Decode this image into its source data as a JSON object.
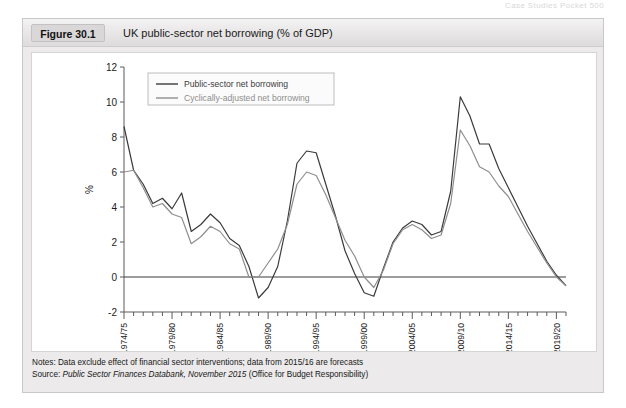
{
  "page_header": "Case Studies Pocket 500",
  "figure": {
    "tag": "Figure 30.1",
    "title": "UK public-sector net borrowing (% of GDP)"
  },
  "notes": {
    "notes_label": "Notes:",
    "notes_text": " Data exclude effect of financial sector interventions; data from 2015/16 are forecasts",
    "source_label": "Source:",
    "source_italic": "Public Sector Finances Databank, November 2015",
    "source_tail": " (Office for Budget Responsibility)"
  },
  "chart_data": {
    "type": "line",
    "title": "UK public-sector net borrowing (% of GDP)",
    "xlabel": "",
    "ylabel": "%",
    "ylim": [
      -2,
      12
    ],
    "yticks": [
      -2,
      0,
      2,
      4,
      6,
      8,
      10,
      12
    ],
    "grid": false,
    "zero_line": true,
    "legend_position": "top-left",
    "x_tick_labels": [
      "1974/75",
      "1979/80",
      "1984/85",
      "1989/90",
      "1994/95",
      "1999/00",
      "2004/05",
      "2009/10",
      "2014/15",
      "2019/20"
    ],
    "x_tick_label_interval": 5,
    "categories": [
      "1974/75",
      "1975/76",
      "1976/77",
      "1977/78",
      "1978/79",
      "1979/80",
      "1980/81",
      "1981/82",
      "1982/83",
      "1983/84",
      "1984/85",
      "1985/86",
      "1986/87",
      "1987/88",
      "1988/89",
      "1989/90",
      "1990/91",
      "1991/92",
      "1992/93",
      "1993/94",
      "1994/95",
      "1995/96",
      "1996/97",
      "1997/98",
      "1998/99",
      "1999/00",
      "2000/01",
      "2001/02",
      "2002/03",
      "2003/04",
      "2004/05",
      "2005/06",
      "2006/07",
      "2007/08",
      "2008/09",
      "2009/10",
      "2010/11",
      "2011/12",
      "2012/13",
      "2013/14",
      "2014/15",
      "2015/16",
      "2016/17",
      "2017/18",
      "2018/19",
      "2019/20",
      "2020/21"
    ],
    "series": [
      {
        "name": "Public-sector net borrowing",
        "color": "#3b3b3b",
        "values": [
          8.6,
          6.1,
          5.3,
          4.2,
          4.5,
          3.9,
          4.8,
          2.6,
          3.0,
          3.6,
          3.1,
          2.2,
          1.8,
          0.6,
          -1.2,
          -0.6,
          0.6,
          3.2,
          6.5,
          7.2,
          7.1,
          5.3,
          3.5,
          1.5,
          0.2,
          -0.9,
          -1.1,
          0.5,
          2.0,
          2.8,
          3.2,
          3.0,
          2.4,
          2.6,
          4.9,
          10.3,
          9.2,
          7.6,
          7.6,
          6.2,
          5.1,
          4.0,
          2.9,
          1.9,
          0.9,
          0.1,
          -0.5
        ]
      },
      {
        "name": "Cyclically-adjusted net borrowing",
        "color": "#8e8e8e",
        "values": [
          6.0,
          6.1,
          5.1,
          4.0,
          4.2,
          3.6,
          3.4,
          1.9,
          2.3,
          2.9,
          2.6,
          1.9,
          1.6,
          0.0,
          0.0,
          0.8,
          1.6,
          3.0,
          5.3,
          6.0,
          5.8,
          4.7,
          3.4,
          2.1,
          1.2,
          0.0,
          -0.6,
          0.4,
          1.9,
          2.7,
          3.0,
          2.7,
          2.2,
          2.4,
          4.2,
          8.4,
          7.5,
          6.3,
          6.0,
          5.2,
          4.6,
          3.6,
          2.6,
          1.7,
          0.8,
          0.0,
          -0.5
        ]
      }
    ]
  }
}
